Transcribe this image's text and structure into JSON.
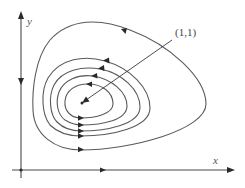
{
  "diagram": {
    "axes": {
      "x_label": "x",
      "y_label": "y"
    },
    "equilibrium": {
      "label": "(1,1)"
    },
    "orbit_count": 5,
    "orbit_direction": "counterclockwise",
    "colors": {
      "stroke": "#5a5a5a",
      "arrow": "#2a2a2a",
      "background": "#ffffff"
    }
  }
}
